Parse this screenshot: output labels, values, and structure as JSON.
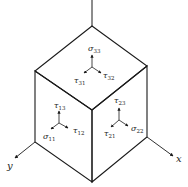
{
  "diagram": {
    "type": "stress-element-cube",
    "colors": {
      "line": "#1a1a1a",
      "text": "#222222",
      "background": "#ffffff"
    },
    "axes": {
      "x": {
        "label": "x"
      },
      "y": {
        "label": "y"
      },
      "z": {
        "label": ""
      }
    },
    "faces": {
      "top": {
        "normal": {
          "symbol": "σ",
          "sub": "33"
        },
        "shear_a": {
          "symbol": "τ",
          "sub": "31"
        },
        "shear_b": {
          "symbol": "τ",
          "sub": "32"
        }
      },
      "left": {
        "normal": {
          "symbol": "σ",
          "sub": "11"
        },
        "shear_a": {
          "symbol": "τ",
          "sub": "13"
        },
        "shear_b": {
          "symbol": "τ",
          "sub": "12"
        }
      },
      "right": {
        "normal": {
          "symbol": "σ",
          "sub": "22"
        },
        "shear_a": {
          "symbol": "τ",
          "sub": "23"
        },
        "shear_b": {
          "symbol": "τ",
          "sub": "21"
        }
      }
    }
  }
}
